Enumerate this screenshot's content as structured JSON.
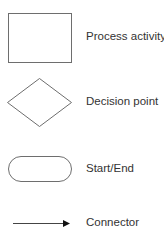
{
  "legend": {
    "items": [
      {
        "shape": "rectangle",
        "label": "Process activity"
      },
      {
        "shape": "diamond",
        "label": "Decision point"
      },
      {
        "shape": "rounded-rectangle",
        "label": "Start/End"
      },
      {
        "shape": "arrow",
        "label": "Connector"
      }
    ]
  },
  "colors": {
    "stroke": "#6e6e6e",
    "text": "#333333",
    "background": "#ffffff"
  }
}
